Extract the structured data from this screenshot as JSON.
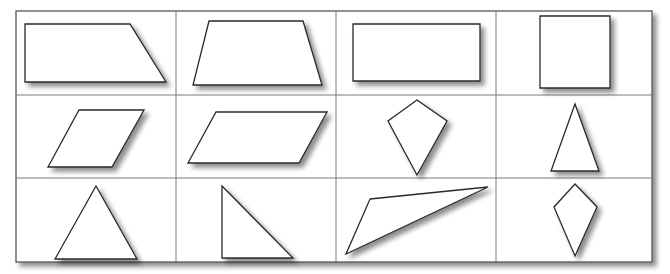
{
  "colors": {
    "background": "#ffffff",
    "outline": "#2a2a2a",
    "grid": "#7a7a7a",
    "shadow": "#9a9a9a"
  },
  "grid": {
    "x": 16,
    "y": 11,
    "width": 636,
    "height": 251,
    "columns": [
      16,
      176,
      336,
      496,
      652
    ],
    "rows": [
      11,
      95,
      178,
      262
    ]
  },
  "cells": [
    {
      "name": "right-trapezoid",
      "row": 1,
      "col": 1,
      "points": "25,24 130,24 166,82 25,82"
    },
    {
      "name": "isosceles-trapezoid",
      "row": 1,
      "col": 2,
      "points": "209,21 303,21 322,85 193,85"
    },
    {
      "name": "rectangle",
      "row": 1,
      "col": 3,
      "points": "353,24 480,24 480,81 353,81"
    },
    {
      "name": "square",
      "row": 1,
      "col": 4,
      "points": "540,16 610,16 610,88 540,88"
    },
    {
      "name": "rhombus",
      "row": 2,
      "col": 1,
      "points": "79,110 144,110 112,167 48,167"
    },
    {
      "name": "parallelogram",
      "row": 2,
      "col": 2,
      "points": "216,112 327,112 299,163 188,163"
    },
    {
      "name": "kite",
      "row": 2,
      "col": 3,
      "points": "417,100 447,121 417,175 388,121"
    },
    {
      "name": "isosceles-triangle",
      "row": 2,
      "col": 4,
      "points": "575,104 599,171 551,171"
    },
    {
      "name": "equilateral-triangle",
      "row": 3,
      "col": 1,
      "points": "96,186 137,259 55,259"
    },
    {
      "name": "right-triangle",
      "row": 3,
      "col": 2,
      "points": "222,186 293,258 222,258"
    },
    {
      "name": "scalene-obtuse-triangle",
      "row": 3,
      "col": 3,
      "points": "370,199 488,187 346,254"
    },
    {
      "name": "kite-small",
      "row": 3,
      "col": 4,
      "points": "575,184 597,207 575,256 554,207"
    }
  ]
}
